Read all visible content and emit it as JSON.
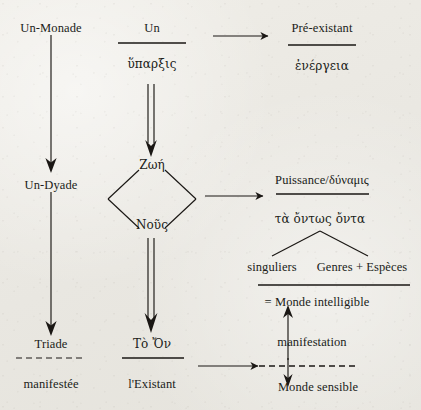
{
  "diagram": {
    "background_color": "#eceae4",
    "ink_color": "#1a1714",
    "width": 421,
    "height": 410,
    "nodes": {
      "un_monade": "Un-Monade",
      "un_dyade": "Un-Dyade",
      "triade": "Triade",
      "manifestee": "manifestée",
      "un": "Un",
      "hyparxis": "ὕπαρξις",
      "zoe": "Ζωή",
      "nous": "Νοῦς",
      "to_on": "Τὸ Ὄν",
      "l_existant": "l'Existant",
      "pre_existant": "Pré-existant",
      "energeia": "ἐνέργεια",
      "puissance_dynamis": "Puissance/δύναμις",
      "ta_ontos_onta": "τὰ ὄντως ὄντα",
      "singuliers": "singuliers",
      "genres_especes": "Genres + Espèces",
      "monde_intelligible": "= Monde intelligible",
      "manifestation": "manifestation",
      "monde_sensible": "Monde sensible"
    },
    "columns": [
      {
        "name": "left-column",
        "items": [
          "Un-Monade",
          "Un-Dyade",
          "Triade",
          "manifestée"
        ]
      },
      {
        "name": "center-column",
        "items": [
          "Un",
          "ὕπαρξις",
          "Ζωή",
          "Νοῦς",
          "Τὸ Ὄν",
          "l'Existant"
        ]
      },
      {
        "name": "right-column",
        "items": [
          "Pré-existant",
          "ἐνέργεια",
          "Puissance/δύναμις",
          "τὰ ὄντως ὄντα",
          "singuliers",
          "Genres + Espèces",
          "= Monde intelligible",
          "manifestation",
          "Monde sensible"
        ]
      }
    ],
    "connectors": [
      {
        "name": "un-monade-to-un-dyade",
        "style": "single-arrow",
        "direction": "down"
      },
      {
        "name": "un-dyade-to-triade",
        "style": "single-arrow",
        "direction": "down"
      },
      {
        "name": "un-to-pre-existant",
        "style": "single-arrow",
        "direction": "right"
      },
      {
        "name": "hyparxis-to-zoe",
        "style": "double-arrow",
        "direction": "down"
      },
      {
        "name": "nous-to-to-on",
        "style": "double-arrow",
        "direction": "down"
      },
      {
        "name": "nous-to-puissance",
        "style": "single-arrow",
        "direction": "right"
      },
      {
        "name": "l-existant-to-monde-sensible",
        "style": "single-arrow",
        "direction": "right"
      },
      {
        "name": "ta-ontos-onta-branch",
        "style": "fork",
        "direction": "down"
      },
      {
        "name": "manifestation-up",
        "style": "single-arrow",
        "direction": "up"
      },
      {
        "name": "manifestation-down",
        "style": "single-arrow",
        "direction": "down"
      },
      {
        "name": "zoe-nous-diamond",
        "style": "diamond",
        "direction": "none"
      }
    ],
    "rules": [
      {
        "name": "rule-under-un",
        "style": "solid"
      },
      {
        "name": "rule-under-pre-existant",
        "style": "solid"
      },
      {
        "name": "rule-under-puissance",
        "style": "solid"
      },
      {
        "name": "rule-under-genres-especes",
        "style": "solid"
      },
      {
        "name": "rule-under-to-on",
        "style": "solid"
      },
      {
        "name": "rule-under-triade",
        "style": "dashed"
      },
      {
        "name": "rule-under-manifestation",
        "style": "dashed"
      }
    ]
  }
}
